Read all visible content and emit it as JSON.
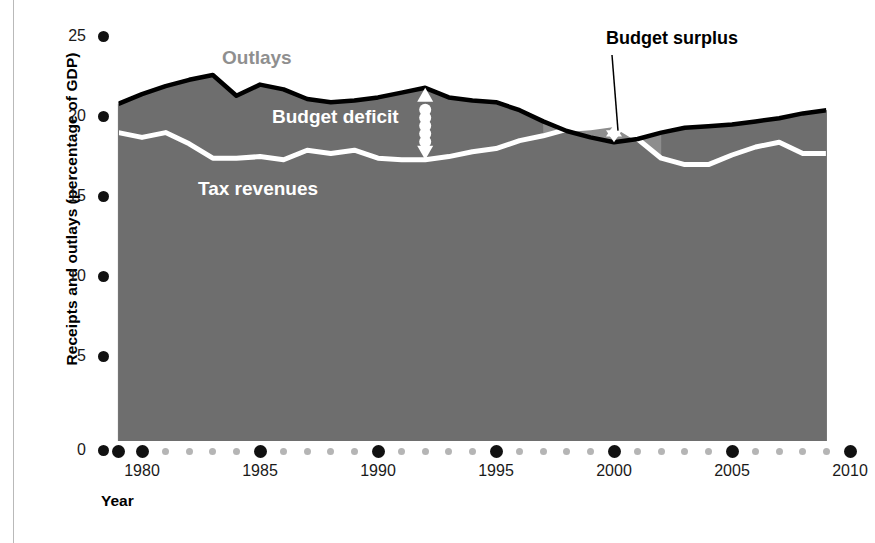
{
  "axes": {
    "ylabel": "Receipts and outlays (percentage of GDP)",
    "xlabel": "Year",
    "yticks": [
      "25",
      "20",
      "15",
      "10",
      "5",
      "0"
    ],
    "xticks": [
      "1980",
      "1985",
      "1990",
      "1995",
      "2000",
      "2005",
      "2010"
    ]
  },
  "annotations": {
    "outlays": "Outlays",
    "deficit": "Budget deficit",
    "revenues": "Tax revenues",
    "surplus": "Budget surplus"
  },
  "colors": {
    "fill": "#6e6e6e",
    "surplus_fill": "#8d8d8d",
    "outlays_line": "#000000",
    "revenue_line": "#ffffff",
    "outlays_label": "#8f8f8f",
    "tick": "#111111",
    "minor_tick": "#b5b5b5"
  },
  "chart_data": {
    "type": "area",
    "title": "",
    "xlabel": "Year",
    "ylabel": "Receipts and outlays (percentage of GDP)",
    "xlim": [
      1979,
      2010
    ],
    "ylim": [
      0,
      26
    ],
    "yticks": [
      0,
      5,
      10,
      15,
      20,
      25
    ],
    "xticks": [
      1980,
      1985,
      1990,
      1995,
      2000,
      2005,
      2010
    ],
    "grid": false,
    "legend": "inline-labels",
    "x": [
      1979,
      1980,
      1981,
      1982,
      1983,
      1984,
      1985,
      1986,
      1987,
      1988,
      1989,
      1990,
      1991,
      1992,
      1993,
      1994,
      1995,
      1996,
      1997,
      1998,
      1999,
      2000,
      2001,
      2002,
      2003,
      2004,
      2005,
      2006,
      2007,
      2008,
      2009
    ],
    "series": [
      {
        "name": "Outlays",
        "values": [
          21.7,
          22.3,
          22.8,
          23.2,
          23.5,
          22.2,
          22.9,
          22.6,
          22.0,
          21.8,
          21.9,
          22.1,
          22.4,
          22.7,
          22.1,
          21.9,
          21.8,
          21.3,
          20.6,
          20.0,
          19.6,
          19.3,
          19.5,
          19.9,
          20.2,
          20.3,
          20.4,
          20.6,
          20.8,
          21.1,
          21.3
        ]
      },
      {
        "name": "Tax revenues",
        "values": [
          19.9,
          19.6,
          19.9,
          19.2,
          18.3,
          18.3,
          18.4,
          18.2,
          18.8,
          18.6,
          18.8,
          18.3,
          18.2,
          18.2,
          18.4,
          18.7,
          18.9,
          19.4,
          19.7,
          20.1,
          20.2,
          20.4,
          19.5,
          18.3,
          17.9,
          17.9,
          18.5,
          19.0,
          19.3,
          18.6,
          18.6
        ]
      }
    ],
    "deficit_marker": {
      "year": 1992,
      "top": 22.7,
      "bottom": 18.2,
      "label": "Budget deficit"
    },
    "surplus_marker": {
      "years": [
        1998,
        2001
      ],
      "label": "Budget surplus",
      "peak_year": 2000,
      "top": 20.4,
      "bottom": 19.3
    }
  }
}
